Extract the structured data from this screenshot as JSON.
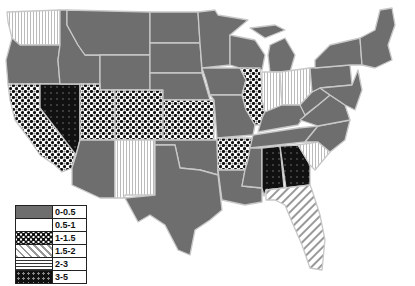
{
  "map": {
    "type": "choropleth",
    "region": "Contiguous United States",
    "fills": {
      "0-0.5": "url(#p-gray)",
      "0.5-1": "url(#p-white)",
      "1-1.5": "url(#p-dots)",
      "1.5-2": "url(#p-diag)",
      "2-3": "url(#p-vert)",
      "3-5": "url(#p-black)"
    },
    "states": [
      {
        "name": "Washington",
        "class": "2-3"
      },
      {
        "name": "Oregon",
        "class": "0-0.5"
      },
      {
        "name": "California",
        "class": "1-1.5"
      },
      {
        "name": "Nevada",
        "class": "3-5"
      },
      {
        "name": "Idaho",
        "class": "0-0.5"
      },
      {
        "name": "Montana",
        "class": "0-0.5"
      },
      {
        "name": "Wyoming",
        "class": "0-0.5"
      },
      {
        "name": "Utah",
        "class": "1-1.5"
      },
      {
        "name": "Arizona",
        "class": "0-0.5"
      },
      {
        "name": "Colorado",
        "class": "1-1.5"
      },
      {
        "name": "New Mexico",
        "class": "2-3"
      },
      {
        "name": "North Dakota",
        "class": "0-0.5"
      },
      {
        "name": "South Dakota",
        "class": "0-0.5"
      },
      {
        "name": "Nebraska",
        "class": "0-0.5"
      },
      {
        "name": "Kansas",
        "class": "1-1.5"
      },
      {
        "name": "Oklahoma",
        "class": "0-0.5"
      },
      {
        "name": "Texas",
        "class": "0-0.5"
      },
      {
        "name": "Minnesota",
        "class": "0-0.5"
      },
      {
        "name": "Iowa",
        "class": "0-0.5"
      },
      {
        "name": "Missouri",
        "class": "0-0.5"
      },
      {
        "name": "Arkansas",
        "class": "1-1.5"
      },
      {
        "name": "Louisiana",
        "class": "0-0.5"
      },
      {
        "name": "Wisconsin",
        "class": "0-0.5"
      },
      {
        "name": "Illinois",
        "class": "1-1.5"
      },
      {
        "name": "Michigan",
        "class": "0-0.5"
      },
      {
        "name": "Indiana",
        "class": "2-3"
      },
      {
        "name": "Ohio",
        "class": "2-3"
      },
      {
        "name": "Kentucky",
        "class": "0-0.5"
      },
      {
        "name": "Tennessee",
        "class": "0-0.5"
      },
      {
        "name": "Mississippi",
        "class": "0-0.5"
      },
      {
        "name": "Alabama",
        "class": "3-5"
      },
      {
        "name": "Georgia",
        "class": "3-5"
      },
      {
        "name": "Florida",
        "class": "1.5-2"
      },
      {
        "name": "South Carolina",
        "class": "2-3"
      },
      {
        "name": "North Carolina",
        "class": "0-0.5"
      },
      {
        "name": "Virginia",
        "class": "0-0.5"
      },
      {
        "name": "West Virginia",
        "class": "0-0.5"
      },
      {
        "name": "Pennsylvania",
        "class": "0-0.5"
      },
      {
        "name": "New York",
        "class": "0-0.5"
      },
      {
        "name": "New England",
        "class": "0-0.5"
      }
    ]
  },
  "legend": {
    "items": [
      {
        "label": "0-0.5",
        "pattern": "solid-gray"
      },
      {
        "label": "0.5-1",
        "pattern": "white"
      },
      {
        "label": "1-1.5",
        "pattern": "dots"
      },
      {
        "label": "1.5-2",
        "pattern": "diagonal-hatch"
      },
      {
        "label": "2-3",
        "pattern": "lines"
      },
      {
        "label": "3-5",
        "pattern": "black-dots"
      }
    ]
  },
  "colors": {
    "base_gray": "#6e6e6e",
    "border": "#c8c8c8",
    "black": "#111111"
  }
}
